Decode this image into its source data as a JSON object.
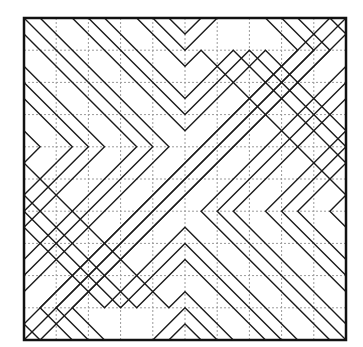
{
  "figure": {
    "frame": {
      "x": 24,
      "y": 18,
      "unit": 32.2,
      "cells": 10,
      "stroke": "#111111",
      "stroke_width": 2.5
    },
    "grid": {
      "color": "#9a9a9a",
      "dash": "2,2",
      "stroke_width": 1
    },
    "line_color": "#1a1a1a",
    "line_width": 1.4,
    "symmetry": "rotate-180-about-center",
    "polylines": [
      [
        [
          0.5,
          0
        ],
        [
          4.5,
          4
        ],
        [
          0,
          8.5
        ]
      ],
      [
        [
          1.5,
          0
        ],
        [
          5,
          3.5
        ],
        [
          7.5,
          1
        ],
        [
          10,
          3.5
        ]
      ],
      [
        [
          2,
          0
        ],
        [
          5,
          3
        ],
        [
          7,
          1
        ],
        [
          10,
          4
        ]
      ],
      [
        [
          2.5,
          0
        ],
        [
          5,
          2.5
        ],
        [
          6.5,
          1
        ],
        [
          10,
          4.5
        ]
      ],
      [
        [
          3.5,
          0
        ],
        [
          5,
          1.5
        ],
        [
          5.5,
          1
        ],
        [
          10,
          5.5
        ]
      ],
      [
        [
          4,
          0
        ],
        [
          5,
          1
        ],
        [
          6,
          0
        ]
      ],
      [
        [
          4.5,
          0
        ],
        [
          5,
          0.5
        ],
        [
          5.5,
          0
        ]
      ],
      [
        [
          7.5,
          0
        ],
        [
          8.5,
          1
        ],
        [
          0,
          9.5
        ]
      ],
      [
        [
          8,
          0
        ],
        [
          9,
          1
        ],
        [
          0,
          10
        ]
      ],
      [
        [
          8.5,
          0
        ],
        [
          9.5,
          1
        ],
        [
          0.5,
          10
        ]
      ],
      [
        [
          9.5,
          0
        ],
        [
          10,
          0.5
        ]
      ],
      [
        [
          0,
          3.5
        ],
        [
          0.5,
          4
        ],
        [
          0,
          4.5
        ]
      ],
      [
        [
          0,
          2.5
        ],
        [
          1.5,
          4
        ],
        [
          0,
          5.5
        ]
      ],
      [
        [
          0,
          2
        ],
        [
          2,
          4
        ],
        [
          0,
          6
        ]
      ],
      [
        [
          0,
          1.5
        ],
        [
          2.5,
          4
        ],
        [
          0,
          6.5
        ]
      ],
      [
        [
          0,
          0.5
        ],
        [
          3.5,
          4
        ],
        [
          0,
          7.5
        ]
      ],
      [
        [
          0,
          0
        ],
        [
          4,
          4
        ],
        [
          0,
          8
        ]
      ]
    ]
  }
}
